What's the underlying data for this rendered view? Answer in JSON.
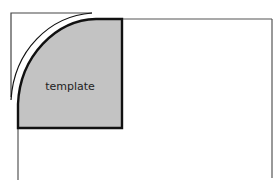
{
  "diagram": {
    "template_label": "template",
    "colors": {
      "template_fill": "#c3c3c3",
      "template_stroke": "#111111",
      "frame_stroke": "#444444",
      "guide_stroke": "#555555",
      "background": "#ffffff"
    }
  }
}
